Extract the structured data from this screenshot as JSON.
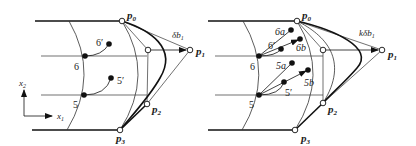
{
  "figure": {
    "left_panel": {
      "points": {
        "p0": {
          "label": "p",
          "sub": "0"
        },
        "p1": {
          "label": "p",
          "sub": "1"
        },
        "p2": {
          "label": "p",
          "sub": "2"
        },
        "p3": {
          "label": "p",
          "sub": "3"
        }
      },
      "displacement_label": {
        "main": "δb",
        "sub": "1"
      },
      "nodes": [
        "6",
        "5",
        "6′",
        "5′"
      ],
      "axes": {
        "x": {
          "main": "x",
          "sub": "1"
        },
        "y": {
          "main": "x",
          "sub": "2"
        }
      }
    },
    "right_panel": {
      "points": {
        "p0": {
          "label": "p",
          "sub": "0"
        },
        "p1": {
          "label": "p",
          "sub": "1"
        },
        "p2": {
          "label": "p",
          "sub": "2"
        },
        "p3": {
          "label": "p",
          "sub": "3"
        }
      },
      "displacement_label": {
        "main": "kδb",
        "sub": "1"
      },
      "nodes": [
        "6",
        "5",
        "6′",
        "5′",
        "6a",
        "6b",
        "5a",
        "5b"
      ]
    }
  }
}
